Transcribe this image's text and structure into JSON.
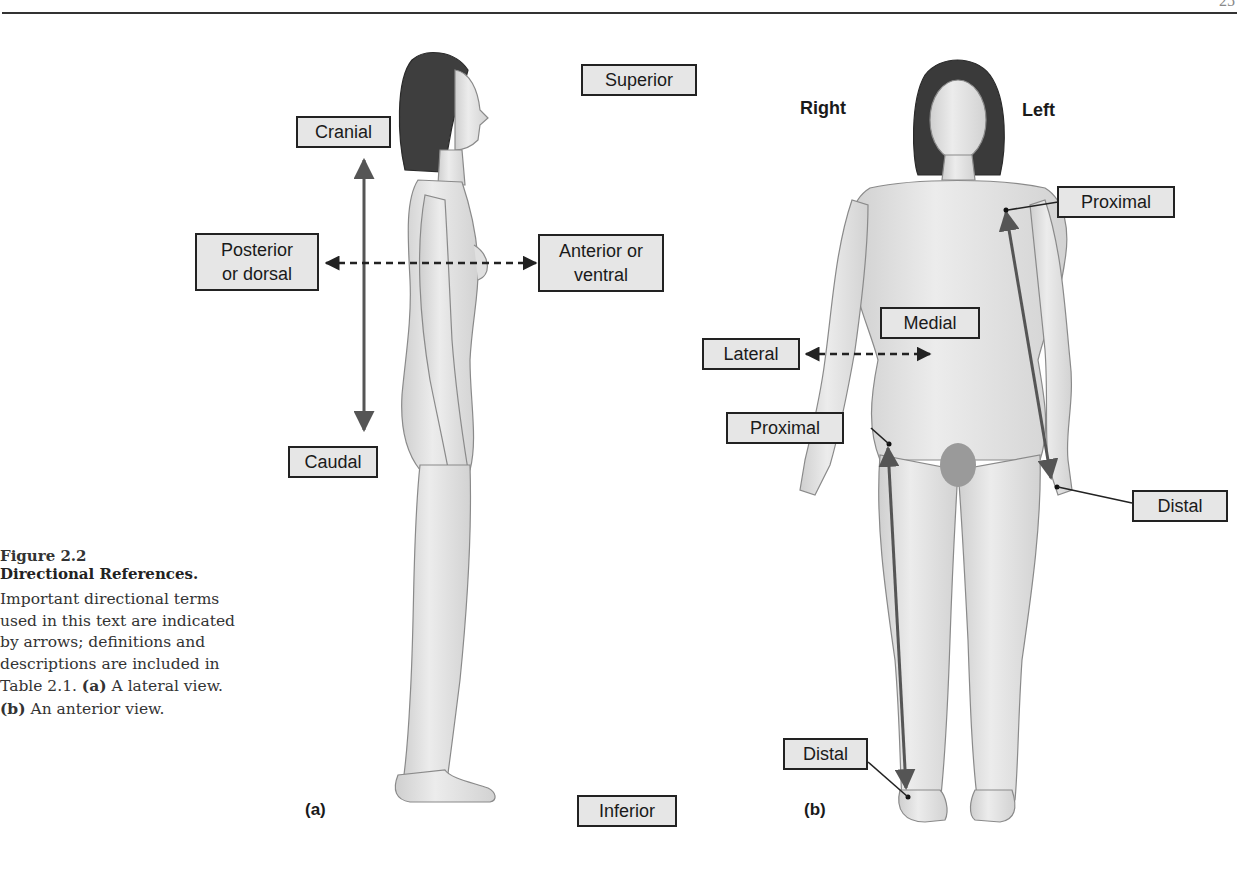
{
  "page": {
    "page_number": "25"
  },
  "caption": {
    "figure_number": "Figure 2.2",
    "title": "Directional References.",
    "body_parts": [
      "Important directional terms used in this text are indicated by arrows; definitions and descriptions are included in Table 2.1. ",
      "(a)",
      " A lateral view. ",
      "(b)",
      " An anterior view."
    ]
  },
  "figure": {
    "shared_labels": {
      "superior": "Superior",
      "inferior": "Inferior"
    },
    "panel_a": {
      "panel_label": "(a)",
      "view": "lateral",
      "labels": {
        "cranial": "Cranial",
        "caudal": "Caudal",
        "posterior_line1": "Posterior",
        "posterior_line2": "or dorsal",
        "anterior_line1": "Anterior or",
        "anterior_line2": "ventral"
      }
    },
    "panel_b": {
      "panel_label": "(b)",
      "view": "anterior",
      "side_right": "Right",
      "side_left": "Left",
      "labels": {
        "proximal_arm": "Proximal",
        "distal_arm": "Distal",
        "medial": "Medial",
        "lateral": "Lateral",
        "proximal_leg": "Proximal",
        "distal_leg": "Distal"
      }
    },
    "colors": {
      "label_fill": "#e6e6e6",
      "label_border": "#222222",
      "arrow_solid": "#555555",
      "arrow_dashed": "#222222",
      "skin": "#e4e4e4",
      "hair": "#3a3a3a"
    }
  }
}
